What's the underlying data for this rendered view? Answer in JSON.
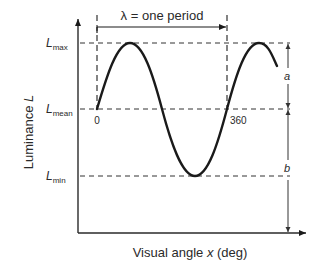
{
  "diagram": {
    "y_axis_label": "Luminance L",
    "y_axis_label_plain": "Luminance ",
    "y_axis_label_var": "L",
    "x_axis_label_plain": "Visual angle ",
    "x_axis_label_var": "x",
    "x_axis_label_unit": " (deg)",
    "period_label": "λ = one period",
    "levels": {
      "max": {
        "base": "L",
        "sub": "max"
      },
      "mean": {
        "base": "L",
        "sub": "mean"
      },
      "min": {
        "base": "L",
        "sub": "min"
      }
    },
    "x_ticks": [
      "0",
      "360"
    ],
    "amplitude_label": "a",
    "mean_label": "b",
    "colors": {
      "line": "#1a1a1a",
      "dashed": "#333333",
      "text": "#2a2a2a"
    }
  }
}
